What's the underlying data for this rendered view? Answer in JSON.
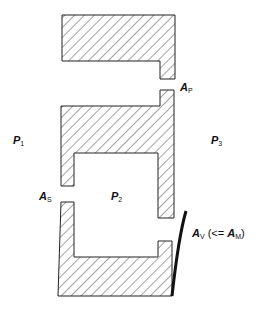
{
  "diagram": {
    "type": "pressure-chamber schematic",
    "labels": {
      "p1": {
        "main": "P",
        "sub": "1"
      },
      "p2": {
        "main": "P",
        "sub": "2"
      },
      "p3": {
        "main": "P",
        "sub": "3"
      },
      "ap": {
        "main": "A",
        "sub": "P"
      },
      "as": {
        "main": "A",
        "sub": "S"
      },
      "av": {
        "main": "A",
        "sub": "V",
        "suffix_open": " (<= ",
        "suffix_main": "A",
        "suffix_sub": "M",
        "suffix_close": ")"
      }
    },
    "colors": {
      "stroke": "#222222",
      "hatch": "#333333",
      "background": "#ffffff"
    }
  }
}
